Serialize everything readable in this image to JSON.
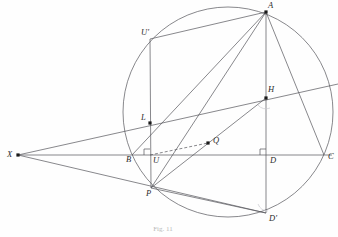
{
  "figure": {
    "caption": "Fig. 11",
    "caption_x": 163,
    "caption_y": 231,
    "stroke_color": "#54545a",
    "dot_color": "#1a1a1a",
    "label_color": "#2b2b2b",
    "faint_color": "#c9c9cf",
    "width": 338,
    "height": 237
  },
  "circle": {
    "name": "circumcircle",
    "cx": 228,
    "cy": 112,
    "r": 105
  },
  "points": [
    {
      "id": "A",
      "label": "A",
      "x": 266,
      "y": 12,
      "lx": 268,
      "ly": 8,
      "dot": true
    },
    {
      "id": "Uprime",
      "label": "U'",
      "x": 150,
      "y": 39,
      "lx": 141,
      "ly": 35,
      "dot": false
    },
    {
      "id": "H",
      "label": "H",
      "x": 266,
      "y": 98,
      "lx": 268,
      "ly": 92,
      "dot": true
    },
    {
      "id": "L",
      "label": "L",
      "x": 150,
      "y": 123,
      "lx": 141,
      "ly": 120,
      "dot": true
    },
    {
      "id": "X",
      "label": "X",
      "x": 18,
      "y": 155,
      "lx": 7,
      "ly": 157,
      "dot": true
    },
    {
      "id": "B",
      "label": "B",
      "x": 132,
      "y": 155,
      "lx": 126,
      "ly": 162,
      "dot": false
    },
    {
      "id": "U",
      "label": "U",
      "x": 150,
      "y": 155,
      "lx": 153,
      "ly": 163,
      "dot": false
    },
    {
      "id": "Q",
      "label": "Q",
      "x": 208,
      "y": 143,
      "lx": 213,
      "ly": 143,
      "dot": true
    },
    {
      "id": "D",
      "label": "D",
      "x": 266,
      "y": 155,
      "lx": 270,
      "ly": 163,
      "dot": false
    },
    {
      "id": "C",
      "label": "C",
      "x": 324,
      "y": 155,
      "lx": 328,
      "ly": 159,
      "dot": false
    },
    {
      "id": "P",
      "label": "P",
      "x": 151,
      "y": 188,
      "lx": 146,
      "ly": 196,
      "dot": false
    },
    {
      "id": "Dprime",
      "label": "D'",
      "x": 266,
      "y": 213,
      "lx": 269,
      "ly": 221,
      "dot": false
    }
  ],
  "segments": [
    {
      "name": "segment-X-to-H",
      "x1": 18,
      "y1": 155,
      "x2": 338,
      "y2": 84,
      "style": "solid"
    },
    {
      "name": "segment-X-to-C",
      "x1": 18,
      "y1": 155,
      "x2": 332,
      "y2": 155,
      "style": "solid"
    },
    {
      "name": "segment-X-to-Dprime",
      "x1": 18,
      "y1": 155,
      "x2": 266,
      "y2": 213,
      "style": "solid"
    },
    {
      "name": "segment-A-to-Uprime",
      "x1": 266,
      "y1": 12,
      "x2": 150,
      "y2": 39,
      "style": "solid"
    },
    {
      "name": "segment-A-to-P",
      "x1": 266,
      "y1": 12,
      "x2": 151,
      "y2": 188,
      "style": "solid"
    },
    {
      "name": "segment-A-to-B",
      "x1": 266,
      "y1": 12,
      "x2": 132,
      "y2": 155,
      "style": "solid"
    },
    {
      "name": "segment-A-to-Dprime",
      "x1": 266,
      "y1": 12,
      "x2": 266,
      "y2": 213,
      "style": "solid"
    },
    {
      "name": "segment-A-to-C",
      "x1": 266,
      "y1": 12,
      "x2": 324,
      "y2": 155,
      "style": "solid"
    },
    {
      "name": "segment-Uprime-to-P",
      "x1": 150,
      "y1": 39,
      "x2": 151,
      "y2": 188,
      "style": "solid"
    },
    {
      "name": "segment-P-to-H",
      "x1": 151,
      "y1": 188,
      "x2": 266,
      "y2": 98,
      "style": "solid"
    },
    {
      "name": "segment-P-to-Dprime",
      "x1": 151,
      "y1": 188,
      "x2": 266,
      "y2": 213,
      "style": "solid"
    },
    {
      "name": "segment-U-to-Q",
      "x1": 150,
      "y1": 155,
      "x2": 208,
      "y2": 143,
      "style": "dashed"
    }
  ],
  "right_angle_marks": [
    {
      "name": "right-angle-at-U",
      "x": 150,
      "y": 155
    },
    {
      "name": "right-angle-at-D",
      "x": 266,
      "y": 155
    }
  ],
  "angle_arcs": [
    {
      "name": "angle-arc-at-H",
      "path": "M 258 105 A 10 10 0 0 0 270 108"
    },
    {
      "name": "angle-arc-at-Dprime",
      "path": "M 258 204 A 11 11 0 0 0 268 211"
    }
  ]
}
